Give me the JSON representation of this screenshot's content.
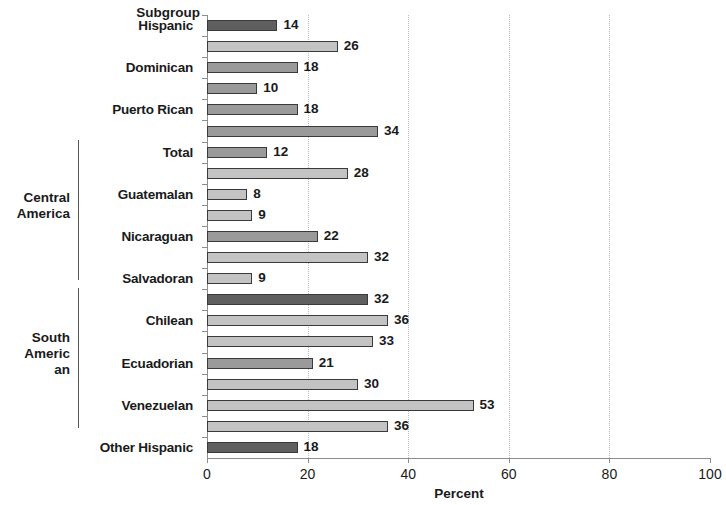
{
  "axis_titles": {
    "y_axis_title": "Subgroup",
    "x_axis_title": "Percent"
  },
  "groups": [
    {
      "name": "Central\nAmerica"
    },
    {
      "name": "South\nAmeric\nan"
    }
  ],
  "x_ticks": [
    "0",
    "20",
    "40",
    "60",
    "80",
    "100"
  ],
  "chart_data": {
    "type": "bar",
    "orientation": "horizontal",
    "title": "",
    "xlabel": "Percent",
    "ylabel": "Subgroup",
    "xlim": [
      0,
      100
    ],
    "grid": "vertical dotted gridlines at 20, 40, 60, 80",
    "legend": "none",
    "categories": [
      "Hispanic",
      "",
      "Dominican",
      "",
      "Puerto Rican",
      "",
      "Total",
      "",
      "Guatemalan",
      "",
      "Nicaraguan",
      "",
      "Salvadoran",
      "",
      "Chilean",
      "",
      "Ecuadorian",
      "",
      "Venezuelan",
      "",
      "Other Hispanic"
    ],
    "values": [
      14,
      26,
      18,
      10,
      18,
      34,
      12,
      28,
      8,
      9,
      22,
      32,
      9,
      32,
      36,
      33,
      21,
      30,
      53,
      36,
      18
    ],
    "data_labels": [
      "14",
      "26",
      "18",
      "10",
      "18",
      "34",
      "12",
      "28",
      "8",
      "9",
      "22",
      "32",
      "9",
      "32",
      "36",
      "33",
      "21",
      "30",
      "53",
      "36",
      "18"
    ],
    "bar_shades": [
      "dark",
      "light",
      "mid",
      "mid",
      "mid",
      "mid",
      "mid",
      "light",
      "light",
      "light",
      "mid",
      "light",
      "light",
      "dark",
      "light",
      "light",
      "mid",
      "light",
      "light",
      "light",
      "dark"
    ],
    "group_brackets": [
      {
        "label": "Central America",
        "categories": [
          "Total",
          "Guatemalan",
          "Nicaraguan",
          "Salvadoran"
        ]
      },
      {
        "label": "South American",
        "categories": [
          "Chilean",
          "Ecuadorian",
          "Venezuelan"
        ]
      }
    ]
  }
}
